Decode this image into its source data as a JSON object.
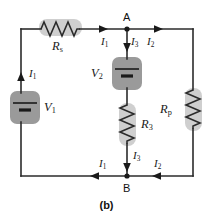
{
  "figure": {
    "caption": "(b)",
    "node_a": "A",
    "node_b": "B"
  },
  "colors": {
    "wire": "#2b2b2b",
    "highlight_light": "#cfcfcf",
    "highlight_dark": "#9a9a9a",
    "text": "#1a1a1a",
    "background": "#ffffff"
  },
  "components": [
    {
      "id": "rs",
      "label": "R",
      "sub": "s",
      "type": "resistor",
      "highlight": "light"
    },
    {
      "id": "v1",
      "label": "V",
      "sub": "1",
      "type": "battery",
      "highlight": "dark"
    },
    {
      "id": "v2",
      "label": "V",
      "sub": "2",
      "type": "battery",
      "highlight": "dark"
    },
    {
      "id": "r3",
      "label": "R",
      "sub": "3",
      "type": "resistor",
      "highlight": "light"
    },
    {
      "id": "rp",
      "label": "R",
      "sub": "p",
      "type": "resistor",
      "highlight": "light"
    }
  ],
  "currents": [
    {
      "id": "i1-left",
      "label": "I",
      "sub": "1",
      "direction": "up"
    },
    {
      "id": "i1-top",
      "label": "I",
      "sub": "1",
      "direction": "right"
    },
    {
      "id": "i3-top",
      "label": "I",
      "sub": "3",
      "direction": "down"
    },
    {
      "id": "i2-top",
      "label": "I",
      "sub": "2",
      "direction": "right"
    },
    {
      "id": "i3-bottom",
      "label": "I",
      "sub": "3",
      "direction": "down"
    },
    {
      "id": "i1-bottom",
      "label": "I",
      "sub": "1",
      "direction": "left"
    },
    {
      "id": "i2-bottom",
      "label": "I",
      "sub": "2",
      "direction": "left"
    }
  ]
}
